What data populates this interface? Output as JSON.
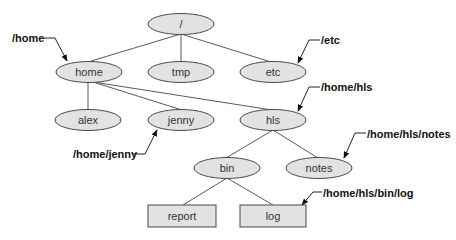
{
  "diagram": {
    "type": "directory-tree",
    "nodes": [
      {
        "id": "root",
        "label": "/",
        "shape": "ellipse"
      },
      {
        "id": "home",
        "label": "home",
        "shape": "ellipse"
      },
      {
        "id": "tmp",
        "label": "tmp",
        "shape": "ellipse"
      },
      {
        "id": "etc",
        "label": "etc",
        "shape": "ellipse"
      },
      {
        "id": "alex",
        "label": "alex",
        "shape": "ellipse"
      },
      {
        "id": "jenny",
        "label": "jenny",
        "shape": "ellipse"
      },
      {
        "id": "hls",
        "label": "hls",
        "shape": "ellipse"
      },
      {
        "id": "bin",
        "label": "bin",
        "shape": "ellipse"
      },
      {
        "id": "notes",
        "label": "notes",
        "shape": "ellipse"
      },
      {
        "id": "report",
        "label": "report",
        "shape": "rectangle"
      },
      {
        "id": "log",
        "label": "log",
        "shape": "rectangle"
      }
    ],
    "edges": [
      [
        "root",
        "home"
      ],
      [
        "root",
        "tmp"
      ],
      [
        "root",
        "etc"
      ],
      [
        "home",
        "alex"
      ],
      [
        "home",
        "jenny"
      ],
      [
        "home",
        "hls"
      ],
      [
        "hls",
        "bin"
      ],
      [
        "hls",
        "notes"
      ],
      [
        "bin",
        "report"
      ],
      [
        "bin",
        "log"
      ]
    ],
    "callouts": [
      {
        "target": "home",
        "text": "/home"
      },
      {
        "target": "etc",
        "text": "/etc"
      },
      {
        "target": "hls",
        "text": "/home/hls"
      },
      {
        "target": "jenny",
        "text": "/home/jenny"
      },
      {
        "target": "notes",
        "text": "/home/hls/notes"
      },
      {
        "target": "log",
        "text": "/home/hls/bin/log"
      }
    ]
  },
  "colors": {
    "node_fill": "#e2e2e2",
    "node_stroke": "#4a4a4a",
    "edge": "#5a5a5a",
    "callout": "#111111"
  }
}
